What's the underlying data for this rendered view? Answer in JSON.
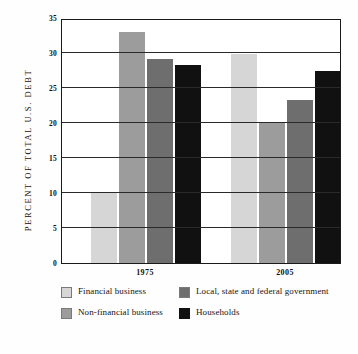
{
  "chart_data": {
    "type": "bar",
    "title": "",
    "subtitle": "",
    "xlabel": "",
    "ylabel": "PERCENT OF TOTAL U.S. DEBT",
    "categories": [
      "1975",
      "2005"
    ],
    "ylim": [
      0,
      35
    ],
    "yticks": [
      0,
      5,
      10,
      15,
      20,
      25,
      30,
      35
    ],
    "ytick_labels": [
      "0",
      "5",
      "10",
      "15",
      "20",
      "25",
      "30",
      "35"
    ],
    "grid": true,
    "grid_axis": "y",
    "legend_position": "below",
    "series": [
      {
        "name": "Financial business",
        "color": "#d6d6d6",
        "values": [
          10.0,
          29.8
        ]
      },
      {
        "name": "Non-financial business",
        "color": "#9c9c9c",
        "values": [
          33.0,
          20.1
        ]
      },
      {
        "name": "Local, state and federal government",
        "color": "#6e6e6e",
        "values": [
          29.1,
          23.3
        ]
      },
      {
        "name": "Households",
        "color": "#111111",
        "values": [
          28.3,
          27.4
        ]
      }
    ]
  },
  "axes": {
    "y_title": "PERCENT OF TOTAL U.S. DEBT",
    "y_ticks": [
      "35",
      "30",
      "25",
      "20",
      "15",
      "10",
      "5",
      "0"
    ],
    "x_ticks": [
      "1975",
      "2005"
    ]
  },
  "legend": {
    "row1": [
      {
        "label": "Financial business",
        "color": "#d6d6d6",
        "swatch": "legend-swatch-financial-business"
      },
      {
        "label": "Local, state and federal government",
        "color": "#6e6e6e",
        "swatch": "legend-swatch-government"
      }
    ],
    "row2": [
      {
        "label": "Non-financial business",
        "color": "#9c9c9c",
        "swatch": "legend-swatch-non-financial-business"
      },
      {
        "label": "Households",
        "color": "#111111",
        "swatch": "legend-swatch-households"
      }
    ]
  },
  "colors": {
    "financial_business": "#d6d6d6",
    "non_financial_business": "#9c9c9c",
    "government": "#6e6e6e",
    "households": "#111111",
    "axis": "#1a1a1a",
    "background": "#ffffff"
  }
}
